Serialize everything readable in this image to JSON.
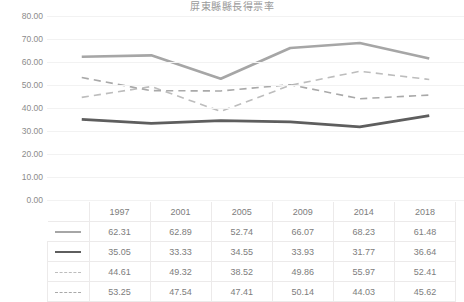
{
  "chart_data": {
    "type": "line",
    "title": "屏東縣縣長得票率",
    "xlabel": "",
    "ylabel": "",
    "categories": [
      "1997",
      "2001",
      "2005",
      "2009",
      "2014",
      "2018"
    ],
    "ylim": [
      0,
      80
    ],
    "ytick_step": 10,
    "yticks": [
      "0.00",
      "10.00",
      "20.00",
      "30.00",
      "40.00",
      "50.00",
      "60.00",
      "70.00",
      "80.00"
    ],
    "grid": true,
    "legend": "table-row-markers",
    "series": [
      {
        "name": "series-1",
        "marker": "solid-light",
        "color": "#a6a6a6",
        "style": "solid",
        "values": [
          62.31,
          62.89,
          52.74,
          66.07,
          68.23,
          61.48
        ]
      },
      {
        "name": "series-2",
        "marker": "solid-dark",
        "color": "#5e5e5e",
        "style": "solid",
        "values": [
          35.05,
          33.33,
          34.55,
          33.93,
          31.77,
          36.64
        ]
      },
      {
        "name": "series-3",
        "marker": "dashed-light",
        "color": "#bdbdbd",
        "style": "dashed",
        "values": [
          44.61,
          49.32,
          38.52,
          49.86,
          55.97,
          52.41
        ]
      },
      {
        "name": "series-4",
        "marker": "dashed-mid",
        "color": "#a9a9a9",
        "style": "dashed",
        "values": [
          53.25,
          47.54,
          47.41,
          50.14,
          44.03,
          45.62
        ]
      }
    ]
  },
  "table": {
    "columns": [
      "1997",
      "2001",
      "2005",
      "2009",
      "2014",
      "2018"
    ],
    "rows": [
      {
        "marker": "solid-light",
        "values": [
          "62.31",
          "62.89",
          "52.74",
          "66.07",
          "68.23",
          "61.48"
        ]
      },
      {
        "marker": "solid-dark",
        "values": [
          "35.05",
          "33.33",
          "34.55",
          "33.93",
          "31.77",
          "36.64"
        ]
      },
      {
        "marker": "dashed-light",
        "values": [
          "44.61",
          "49.32",
          "38.52",
          "49.86",
          "55.97",
          "52.41"
        ]
      },
      {
        "marker": "dashed-mid",
        "values": [
          "53.25",
          "47.54",
          "47.41",
          "50.14",
          "44.03",
          "45.62"
        ]
      }
    ]
  },
  "colors": {
    "gridline": "#f2f2f2",
    "table_border": "#eceaea",
    "text": "#808080",
    "title": "#9a9a9a",
    "background": "#ffffff"
  }
}
